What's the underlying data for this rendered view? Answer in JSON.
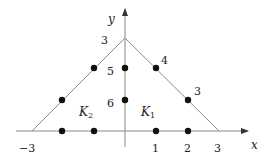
{
  "diagram": {
    "axes": {
      "x_label": "x",
      "y_label": "y"
    },
    "x_ticks": [
      {
        "label": "−3",
        "value": -3
      },
      {
        "label": "1",
        "value": 1
      },
      {
        "label": "2",
        "value": 2
      },
      {
        "label": "3",
        "value": 3
      }
    ],
    "regions": [
      {
        "name": "K",
        "sub": "1",
        "side": "right"
      },
      {
        "name": "K",
        "sub": "2",
        "side": "left"
      }
    ],
    "triangle": {
      "vertices": [
        [
          -3,
          0
        ],
        [
          0,
          3
        ],
        [
          3,
          0
        ]
      ],
      "split_by": "y-axis"
    },
    "nodes": [
      {
        "x": -2,
        "y": 0
      },
      {
        "x": -1,
        "y": 0
      },
      {
        "x": 1,
        "y": 0
      },
      {
        "x": 2,
        "y": 0
      },
      {
        "x": -2,
        "y": 1
      },
      {
        "x": -1,
        "y": 2
      },
      {
        "x": 0,
        "y": 1
      },
      {
        "x": 0,
        "y": 2
      },
      {
        "x": 1,
        "y": 2
      },
      {
        "x": 2,
        "y": 1
      }
    ],
    "node_labels": [
      {
        "label": "3",
        "near": "apex-left"
      },
      {
        "label": "5",
        "near": "axis-node-y2"
      },
      {
        "label": "6",
        "near": "axis-node-y1"
      },
      {
        "label": "4",
        "near": "right-edge-node-upper"
      },
      {
        "label": "3",
        "near": "right-edge-node-lower"
      }
    ],
    "colors": {
      "line": "#8a8a8a",
      "axis": "#888888",
      "node": "#111111",
      "text": "#222222"
    }
  }
}
